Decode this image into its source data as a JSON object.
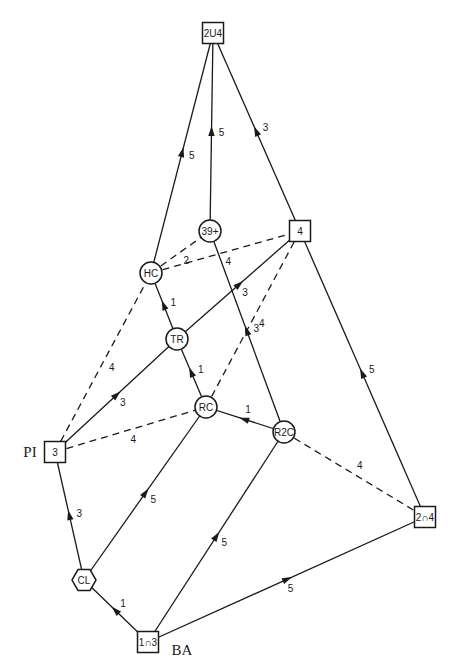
{
  "diagram": {
    "nodes": [
      {
        "id": "2U4",
        "label": "2U4",
        "shape": "square",
        "x": 213,
        "y": 33
      },
      {
        "id": "39+",
        "label": "39+",
        "shape": "circle",
        "x": 210,
        "y": 231
      },
      {
        "id": "4",
        "label": "4",
        "shape": "square",
        "x": 300,
        "y": 231
      },
      {
        "id": "HC",
        "label": "HC",
        "shape": "circle",
        "x": 151,
        "y": 273
      },
      {
        "id": "TR",
        "label": "TR",
        "shape": "circle",
        "x": 177,
        "y": 339
      },
      {
        "id": "RC",
        "label": "RC",
        "shape": "circle",
        "x": 206,
        "y": 407
      },
      {
        "id": "R2C",
        "label": "R2C",
        "shape": "circle",
        "x": 284,
        "y": 432
      },
      {
        "id": "PI",
        "label": "3",
        "shape": "square",
        "x": 55,
        "y": 452,
        "side_label": "PI"
      },
      {
        "id": "2n4",
        "label": "2∩4",
        "shape": "square",
        "x": 425,
        "y": 517
      },
      {
        "id": "CL",
        "label": "CL",
        "shape": "hexagon",
        "x": 84,
        "y": 580
      },
      {
        "id": "1n3",
        "label": "1∩3",
        "shape": "square",
        "x": 148,
        "y": 642,
        "side_label": "BA"
      }
    ],
    "edges": [
      {
        "from": "HC",
        "to": "2U4",
        "weight": "5",
        "style": "solid",
        "arrow": true
      },
      {
        "from": "39+",
        "to": "2U4",
        "weight": "5",
        "style": "solid",
        "arrow": true
      },
      {
        "from": "4",
        "to": "2U4",
        "weight": "3",
        "style": "solid",
        "arrow": true
      },
      {
        "from": "HC",
        "to": "39+",
        "weight": "2",
        "style": "dashed",
        "arrow": false
      },
      {
        "from": "HC",
        "to": "4",
        "weight": "4",
        "style": "dashed",
        "arrow": false
      },
      {
        "from": "TR",
        "to": "HC",
        "weight": "1",
        "style": "solid",
        "arrow": true
      },
      {
        "from": "PI",
        "to": "HC",
        "weight": "4",
        "style": "dashed",
        "arrow": false
      },
      {
        "from": "TR",
        "to": "4",
        "weight": "3",
        "style": "solid",
        "arrow": true
      },
      {
        "from": "PI",
        "to": "TR",
        "weight": "3",
        "style": "solid",
        "arrow": true
      },
      {
        "from": "RC",
        "to": "TR",
        "weight": "1",
        "style": "solid",
        "arrow": true
      },
      {
        "from": "RC",
        "to": "4",
        "weight": "4",
        "style": "dashed",
        "arrow": false
      },
      {
        "from": "R2C",
        "to": "39+",
        "weight": "3",
        "style": "solid",
        "arrow": true
      },
      {
        "from": "2n4",
        "to": "4",
        "weight": "5",
        "style": "solid",
        "arrow": true
      },
      {
        "from": "PI",
        "to": "RC",
        "weight": "4",
        "style": "dashed",
        "arrow": false
      },
      {
        "from": "R2C",
        "to": "RC",
        "weight": "1",
        "style": "solid",
        "arrow": true
      },
      {
        "from": "R2C",
        "to": "2n4",
        "weight": "4",
        "style": "dashed",
        "arrow": false
      },
      {
        "from": "CL",
        "to": "PI",
        "weight": "3",
        "style": "solid",
        "arrow": true
      },
      {
        "from": "CL",
        "to": "RC",
        "weight": "5",
        "style": "solid",
        "arrow": true
      },
      {
        "from": "1n3",
        "to": "R2C",
        "weight": "5",
        "style": "solid",
        "arrow": true
      },
      {
        "from": "1n3",
        "to": "CL",
        "weight": "1",
        "style": "solid",
        "arrow": true
      },
      {
        "from": "1n3",
        "to": "2n4",
        "weight": "5",
        "style": "solid",
        "arrow": true
      }
    ]
  }
}
